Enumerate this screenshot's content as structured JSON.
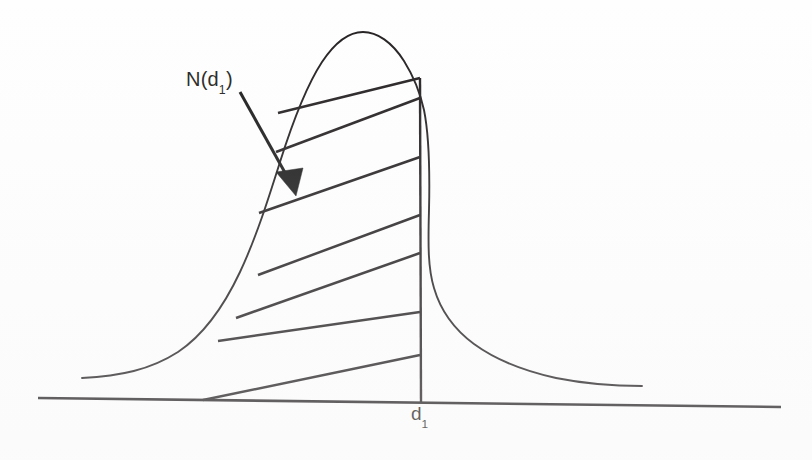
{
  "figure": {
    "background_color": "#fefefe",
    "ink_color": "#231f20"
  },
  "labels": {
    "curve_label": {
      "base": "N(d",
      "subscript": "1",
      "close": ")",
      "full_text": "N(d1)"
    },
    "axis_label": {
      "base": "d",
      "subscript": "1",
      "full_text": "d1"
    }
  },
  "annotation": {
    "arrow_name": "pointer-arrow",
    "from_label": "N(d1)",
    "points_to": "shaded-region"
  },
  "chart_data": {
    "type": "area",
    "title": "",
    "subtitle": "",
    "xlabel": "",
    "ylabel": "",
    "grid": false,
    "legend_position": "none",
    "annotations": [
      {
        "text": "N(d1)",
        "target": "shaded-area",
        "style": "arrow"
      },
      {
        "text": "d1",
        "target": "x-axis-tick",
        "style": "axis-label"
      }
    ],
    "axis": {
      "x_start_px": 38,
      "x_end_px": 781,
      "y_start_px": 398,
      "y_end_px": 407,
      "tick_at_d1_px": 420
    },
    "curve": {
      "description": "bell-shaped normal density curve, left tail begins at x=82, peak near x=363, right tail ends at x=642",
      "peak_x_px": 363,
      "peak_y_px": 33,
      "left_tail_x_px": 82,
      "left_tail_y_px": 378,
      "right_tail_x_px": 642,
      "right_tail_y_px": 385
    },
    "shaded_region": {
      "fill_style": "diagonal-hatching",
      "hatch_count": 7,
      "left_boundary": "curve",
      "right_boundary": "vertical line at d1",
      "bottom_boundary": "x-axis",
      "meaning": "cumulative probability to the left of d1"
    },
    "hatch_lines": [
      {
        "x1": 278,
        "y1": 113,
        "x2": 420,
        "y2": 78
      },
      {
        "x1": 276,
        "y1": 152,
        "x2": 420,
        "y2": 98
      },
      {
        "x1": 259,
        "y1": 213,
        "x2": 420,
        "y2": 157
      },
      {
        "x1": 258,
        "y1": 275,
        "x2": 420,
        "y2": 215
      },
      {
        "x1": 236,
        "y1": 318,
        "x2": 420,
        "y2": 253
      },
      {
        "x1": 218,
        "y1": 341,
        "x2": 420,
        "y2": 312
      },
      {
        "x1": 203,
        "y1": 400,
        "x2": 420,
        "y2": 355
      }
    ]
  }
}
